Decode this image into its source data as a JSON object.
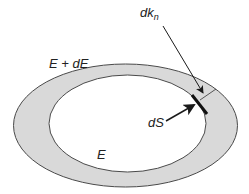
{
  "diagram": {
    "labels": {
      "outer_surface": "E + dE",
      "inner_surface": "E",
      "normal_increment_main": "dk",
      "normal_increment_sub": "n",
      "surface_element": "dS"
    },
    "colors": {
      "shell_fill": "#d9d9d9",
      "inner_fill": "#ffffff",
      "stroke": "#4a4a4a",
      "arrow": "#1a1a1a",
      "text": "#222222"
    },
    "shapes": {
      "outer_ellipse": {
        "cx": 125.5,
        "cy": 125.5,
        "rx": 125,
        "ry": 61.5
      },
      "inner_ellipse": {
        "cx": 127.5,
        "cy": 123.5,
        "rx": 78.5,
        "ry": 48.5
      },
      "surface_element_segment": {
        "x1": 192,
        "y1": 95,
        "x2": 207,
        "y2": 114
      },
      "normal_line": {
        "x1": 200,
        "y1": 100,
        "x2": 216,
        "y2": 89
      },
      "dk_arrow": {
        "x1": 163,
        "y1": 26,
        "x2": 203,
        "y2": 93
      },
      "dS_arrow": {
        "x1": 166,
        "y1": 121,
        "x2": 194,
        "y2": 105
      }
    }
  }
}
